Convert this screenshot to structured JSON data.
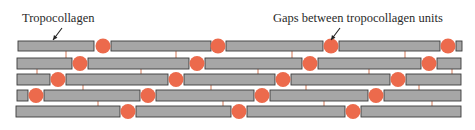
{
  "diagram": {
    "labels": [
      {
        "id": "tropocollagen",
        "text": "Tropocollagen",
        "x": 22,
        "y": 22,
        "arrow": {
          "from": [
            62,
            28
          ],
          "to": [
            53,
            40
          ]
        }
      },
      {
        "id": "gaps",
        "text": "Gaps between tropocollagen units",
        "x": 273,
        "y": 22,
        "arrow": {
          "from": [
            340,
            28
          ],
          "to": [
            331,
            40
          ]
        }
      }
    ],
    "colors": {
      "molecule_fill": "#a6a6a6",
      "molecule_stroke": "#3a3a3a",
      "gap_fill": "#ec6a4c",
      "crosslink": "#d98a6e"
    },
    "rows": [
      {
        "y": 41,
        "h": 10,
        "bars": [
          [
            18,
            94
          ],
          [
            111,
            211
          ],
          [
            226,
            323
          ],
          [
            339,
            440
          ],
          [
            456,
            462
          ]
        ],
        "gaps": [
          103,
          218,
          331,
          448
        ]
      },
      {
        "y": 58,
        "h": 11,
        "bars": [
          [
            17,
            72
          ],
          [
            88,
            189
          ],
          [
            205,
            302
          ],
          [
            318,
            421
          ],
          [
            437,
            461
          ]
        ],
        "gaps": [
          80,
          197,
          310,
          429
        ]
      },
      {
        "y": 74,
        "h": 11,
        "bars": [
          [
            17,
            50
          ],
          [
            66,
            168
          ],
          [
            184,
            275
          ],
          [
            291,
            390
          ],
          [
            406,
            461
          ]
        ],
        "gaps": [
          58,
          176,
          283,
          398
        ]
      },
      {
        "y": 90,
        "h": 11,
        "bars": [
          [
            17,
            28
          ],
          [
            44,
            140
          ],
          [
            156,
            254
          ],
          [
            270,
            368
          ],
          [
            384,
            461
          ]
        ],
        "gaps": [
          36,
          148,
          262,
          376
        ]
      },
      {
        "y": 106,
        "h": 11,
        "bars": [
          [
            16,
            120
          ],
          [
            136,
            231
          ],
          [
            247,
            345
          ],
          [
            361,
            461
          ]
        ],
        "gaps": [
          128,
          239,
          353
        ]
      }
    ],
    "crosslinks": [
      {
        "x": 66,
        "y1": 51,
        "y2": 58
      },
      {
        "x": 176,
        "y1": 51,
        "y2": 58
      },
      {
        "x": 292,
        "y1": 51,
        "y2": 58
      },
      {
        "x": 405,
        "y1": 51,
        "y2": 58
      },
      {
        "x": 37,
        "y1": 69,
        "y2": 74
      },
      {
        "x": 141,
        "y1": 69,
        "y2": 74
      },
      {
        "x": 258,
        "y1": 69,
        "y2": 74
      },
      {
        "x": 369,
        "y1": 69,
        "y2": 74
      },
      {
        "x": 452,
        "y1": 69,
        "y2": 74
      },
      {
        "x": 83,
        "y1": 85,
        "y2": 90
      },
      {
        "x": 211,
        "y1": 85,
        "y2": 90
      },
      {
        "x": 306,
        "y1": 85,
        "y2": 90
      },
      {
        "x": 419,
        "y1": 85,
        "y2": 90
      },
      {
        "x": 98,
        "y1": 101,
        "y2": 106
      },
      {
        "x": 223,
        "y1": 101,
        "y2": 106
      },
      {
        "x": 324,
        "y1": 101,
        "y2": 106
      },
      {
        "x": 432,
        "y1": 101,
        "y2": 106
      }
    ],
    "gap_radius": 7.5
  }
}
